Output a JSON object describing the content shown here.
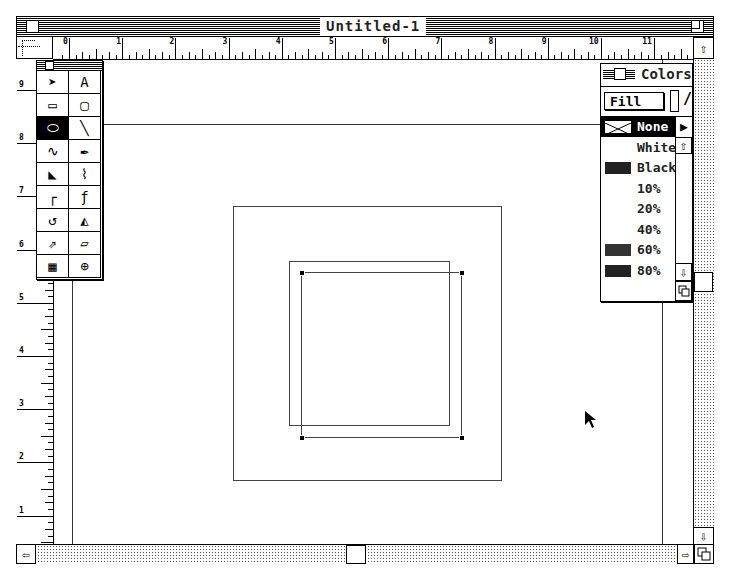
{
  "window": {
    "title": "Untitled-1"
  },
  "rulers": {
    "horizontal_labels": [
      "0",
      "1",
      "2",
      "3",
      "4",
      "5",
      "6",
      "7",
      "8",
      "9",
      "10",
      "11"
    ],
    "vertical_labels": [
      "9",
      "8",
      "7",
      "6",
      "5",
      "4",
      "3",
      "2",
      "1"
    ]
  },
  "toolbox": {
    "tools": [
      {
        "name": "pointer-tool",
        "glyph": "➤"
      },
      {
        "name": "text-tool",
        "glyph": "A"
      },
      {
        "name": "rectangle-tool",
        "glyph": "▭"
      },
      {
        "name": "rounded-rectangle-tool",
        "glyph": "▢"
      },
      {
        "name": "ellipse-tool",
        "glyph": "⬭"
      },
      {
        "name": "line-tool",
        "glyph": "╲"
      },
      {
        "name": "freehand-tool",
        "glyph": "∿"
      },
      {
        "name": "pen-tool",
        "glyph": "✒"
      },
      {
        "name": "knife-tool",
        "glyph": "◣"
      },
      {
        "name": "curve-tool",
        "glyph": "⌇"
      },
      {
        "name": "corner-point-tool",
        "glyph": "┌"
      },
      {
        "name": "connector-point-tool",
        "glyph": "ƒ"
      },
      {
        "name": "rotate-tool",
        "glyph": "↺"
      },
      {
        "name": "reflect-tool",
        "glyph": "◭"
      },
      {
        "name": "scale-tool",
        "glyph": "⇗"
      },
      {
        "name": "skew-tool",
        "glyph": "▱"
      },
      {
        "name": "trace-tool",
        "glyph": "▦"
      },
      {
        "name": "zoom-tool",
        "glyph": "⊕"
      }
    ],
    "selected_index": 4
  },
  "colors_palette": {
    "title": "Colors",
    "mode": "Fill",
    "items": [
      {
        "label": "None",
        "selected": true,
        "swatch": "none"
      },
      {
        "label": "White",
        "swatch": "white"
      },
      {
        "label": "Black",
        "swatch": "#222222"
      },
      {
        "label": "10%",
        "swatch": "none"
      },
      {
        "label": "20%",
        "swatch": "none"
      },
      {
        "label": "40%",
        "swatch": "none"
      },
      {
        "label": "60%",
        "swatch": "#333333"
      },
      {
        "label": "80%",
        "swatch": "#222222"
      }
    ]
  },
  "canvas": {
    "shapes": [
      {
        "type": "rectangle",
        "x": 233,
        "y": 206,
        "w": 269,
        "h": 275
      },
      {
        "type": "rectangle",
        "x": 289,
        "y": 261,
        "w": 161,
        "h": 165
      },
      {
        "type": "rectangle",
        "x": 301,
        "y": 272,
        "w": 161,
        "h": 166,
        "selected": true
      }
    ]
  },
  "scrollbars": {
    "up_arrow": "⇧",
    "down_arrow": "⇩",
    "left_arrow": "⇦",
    "right_arrow": "⇨"
  }
}
